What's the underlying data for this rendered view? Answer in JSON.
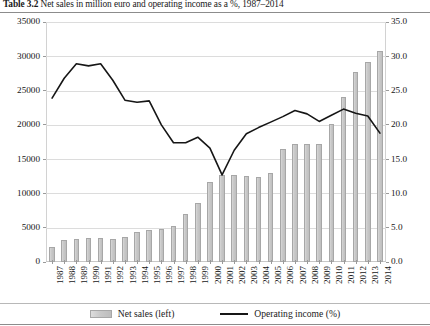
{
  "title": {
    "number": "Table 3.2",
    "text": "Net sales in million euro and operating income as a %, 1987–2014"
  },
  "legend": {
    "bars": "Net sales (left)",
    "line": "Operating income (%)"
  },
  "axes": {
    "left_ticks": [
      "0",
      "5000",
      "10000",
      "15000",
      "20000",
      "25000",
      "30000",
      "35000"
    ],
    "right_ticks": [
      "0.0",
      "5.0",
      "10.0",
      "15.0",
      "20.0",
      "25.0",
      "30.0",
      "35.0"
    ]
  },
  "chart_data": {
    "type": "bar",
    "title": "Net sales in million euro and operating income as a %, 1987–2014",
    "xlabel": "",
    "ylabel": "Net sales (million euro)",
    "y2label": "Operating income (%)",
    "ylim": [
      0,
      35000
    ],
    "y2lim": [
      0,
      35
    ],
    "grid": true,
    "legend_position": "bottom",
    "categories": [
      "1987",
      "1988",
      "1989",
      "1990",
      "1991",
      "1992",
      "1993",
      "1994",
      "1995",
      "1996",
      "1997",
      "1998",
      "1999",
      "2000",
      "2001",
      "2002",
      "2003",
      "2004",
      "2005",
      "2006",
      "2007",
      "2008",
      "2009",
      "2010",
      "2011",
      "2012",
      "2013",
      "2014"
    ],
    "series": [
      {
        "name": "Net sales (left)",
        "type": "bar",
        "axis": "left",
        "color": "#c9c9c9",
        "values": [
          2200,
          3200,
          3400,
          3500,
          3500,
          3400,
          3600,
          4400,
          4700,
          4800,
          5300,
          7000,
          8600,
          11700,
          12700,
          12700,
          12500,
          12400,
          13000,
          16500,
          17200,
          17200,
          17200,
          20100,
          24000,
          27700,
          29100,
          30800
        ]
      },
      {
        "name": "Operating income (%)",
        "type": "line",
        "axis": "right",
        "color": "#161616",
        "values": [
          23.9,
          26.8,
          28.9,
          28.6,
          28.9,
          26.5,
          23.6,
          23.3,
          23.5,
          20.0,
          17.4,
          17.4,
          18.2,
          16.6,
          12.7,
          16.3,
          18.7,
          19.6,
          20.4,
          21.2,
          22.1,
          21.6,
          20.5,
          21.4,
          22.3,
          21.7,
          21.3,
          18.8
        ]
      }
    ]
  }
}
